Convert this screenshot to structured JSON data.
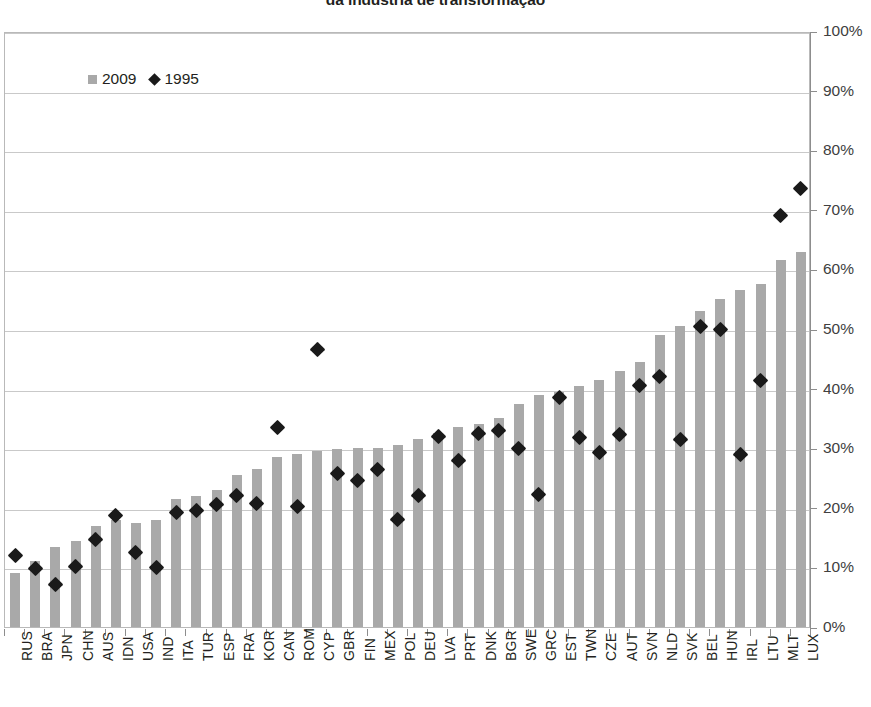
{
  "title": "da indústria de transformação",
  "legend": {
    "items": [
      {
        "label": "2009",
        "marker": "square-marker",
        "color": "#a9a9a9"
      },
      {
        "label": "1995",
        "marker": "diamond-marker",
        "color": "#1a1a1a"
      }
    ]
  },
  "axis": {
    "y_ticks": [
      "0%",
      "10%",
      "20%",
      "30%",
      "40%",
      "50%",
      "60%",
      "70%",
      "80%",
      "90%",
      "100%"
    ]
  },
  "chart_data": {
    "type": "bar",
    "title": "da indústria de transformação",
    "xlabel": "",
    "ylabel": "",
    "ylim": [
      0,
      100
    ],
    "ytick_step": 10,
    "grid": true,
    "legend_position": "top-left",
    "categories": [
      "RUS",
      "BRA",
      "JPN",
      "CHN",
      "AUS",
      "IDN",
      "USA",
      "IND",
      "ITA",
      "TUR",
      "ESP",
      "FRA",
      "KOR",
      "CAN",
      "ROM",
      "CYP",
      "GBR",
      "FIN",
      "MEX",
      "POL",
      "DEU",
      "LVA",
      "PRT",
      "DNK",
      "BGR",
      "SWE",
      "GRC",
      "EST",
      "TWN",
      "CZE",
      "AUT",
      "SVN",
      "NLD",
      "SVK",
      "BEL",
      "HUN",
      "IRL",
      "LTU",
      "MLT",
      "LUX"
    ],
    "series": [
      {
        "name": "2009",
        "type": "bar",
        "color": "#a9a9a9",
        "values": [
          9.0,
          11.0,
          13.5,
          14.5,
          17.0,
          18.0,
          17.5,
          18.0,
          21.5,
          22.0,
          23.0,
          25.5,
          26.5,
          28.5,
          29.0,
          29.5,
          29.8,
          30.0,
          30.0,
          30.5,
          31.5,
          32.5,
          33.5,
          34.0,
          35.0,
          37.5,
          39.0,
          39.5,
          40.5,
          41.5,
          43.0,
          44.5,
          49.0,
          50.5,
          53.0,
          55.0,
          56.5,
          57.5,
          61.5,
          63.0
        ]
      },
      {
        "name": "1995",
        "type": "scatter",
        "color": "#1a1a1a",
        "values": [
          12.0,
          9.8,
          7.2,
          10.2,
          14.7,
          18.7,
          12.5,
          10.0,
          19.2,
          19.5,
          20.5,
          22.0,
          20.8,
          33.5,
          20.3,
          46.5,
          25.8,
          24.5,
          26.5,
          18.0,
          22.0,
          32.0,
          28.0,
          32.5,
          33.0,
          30.0,
          22.3,
          38.5,
          31.8,
          29.3,
          32.3,
          40.5,
          42.0,
          31.5,
          50.5,
          50.0,
          29.0,
          41.3,
          69.0,
          73.5
        ]
      }
    ]
  }
}
